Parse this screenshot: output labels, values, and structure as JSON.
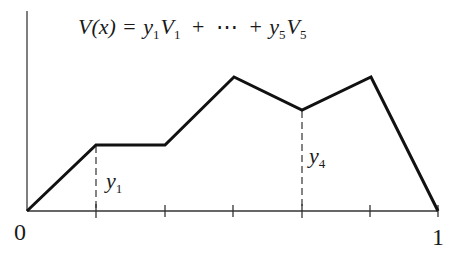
{
  "diagram": {
    "type": "piecewise-linear-function",
    "formula": {
      "lhs": "V(x)",
      "equals": "=",
      "term1_coef": "y",
      "term1_coef_sub": "1",
      "term1_fn": "V",
      "term1_fn_sub": "1",
      "plus1": "+",
      "ellipsis": "⋯",
      "plus2": "+",
      "term5_coef": "y",
      "term5_coef_sub": "5",
      "term5_fn": "V",
      "term5_fn_sub": "5"
    },
    "axis_labels": {
      "origin": "0",
      "end": "1"
    },
    "annotations": [
      {
        "label": "y",
        "sub": "1",
        "node_index": 1
      },
      {
        "label": "y",
        "sub": "4",
        "node_index": 4
      }
    ],
    "nodes_x": [
      0,
      0.1667,
      0.3333,
      0.5,
      0.6667,
      0.8333,
      1
    ],
    "node_values": [
      0,
      0.49,
      0.49,
      1.0,
      0.75,
      1.0,
      0
    ],
    "tick_count": 5,
    "colors": {
      "line": "#111111",
      "axis": "#333333",
      "dashed": "#333333"
    }
  }
}
